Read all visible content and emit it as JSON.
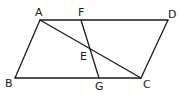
{
  "figure": {
    "type": "geometry-parallelogram",
    "points": {
      "A": {
        "label": "A",
        "x": 40,
        "y": 20,
        "lx": 35,
        "ly": 16
      },
      "F": {
        "label": "F",
        "x": 81,
        "y": 20,
        "lx": 78,
        "ly": 16
      },
      "D": {
        "label": "D",
        "x": 168,
        "y": 20,
        "lx": 168,
        "ly": 18
      },
      "B": {
        "label": "B",
        "x": 15,
        "y": 78,
        "lx": 5,
        "ly": 87
      },
      "G": {
        "label": "G",
        "x": 99,
        "y": 78,
        "lx": 95,
        "ly": 90
      },
      "C": {
        "label": "C",
        "x": 141,
        "y": 78,
        "lx": 143,
        "ly": 88
      },
      "E": {
        "label": "E",
        "x": 90,
        "y": 49,
        "lx": 80,
        "ly": 60
      }
    },
    "segments": [
      [
        "A",
        "D"
      ],
      [
        "D",
        "C"
      ],
      [
        "C",
        "B"
      ],
      [
        "B",
        "A"
      ],
      [
        "A",
        "C"
      ],
      [
        "F",
        "G"
      ]
    ]
  }
}
